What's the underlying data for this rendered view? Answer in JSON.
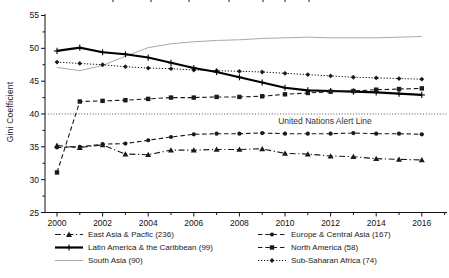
{
  "figure": {
    "background": "#ffffff",
    "axis_color": "#111111",
    "alert_line_color": "#444444"
  },
  "chart_data": {
    "type": "line",
    "title": "",
    "xlabel": "",
    "ylabel": "Gini Coefficient",
    "ylim": [
      25,
      55
    ],
    "xlim": [
      1999.4,
      2017.2
    ],
    "yticks": [
      25,
      30,
      35,
      40,
      45,
      50,
      55
    ],
    "xticks": [
      2000,
      2002,
      2004,
      2006,
      2008,
      2010,
      2012,
      2014,
      2016
    ],
    "grid": false,
    "legend_position": "bottom-two-columns",
    "annotation": {
      "text": "United Nations Alert Line",
      "value": 40,
      "style": "dotted-horizontal-line"
    },
    "x": [
      2000,
      2001,
      2002,
      2003,
      2004,
      2005,
      2006,
      2007,
      2008,
      2009,
      2010,
      2011,
      2012,
      2013,
      2014,
      2015,
      2016
    ],
    "series": [
      {
        "name": "East Asia & Pacfic (236)",
        "marker": "triangle",
        "line": "dashdot",
        "color": "#1a1a1a",
        "values": [
          35.2,
          34.9,
          35.3,
          33.9,
          33.8,
          34.5,
          34.5,
          34.6,
          34.6,
          34.7,
          34.0,
          33.9,
          33.6,
          33.5,
          33.2,
          33.1,
          33.0
        ]
      },
      {
        "name": "Europe & Central Asia (167)",
        "marker": "circle",
        "line": "dashed",
        "color": "#1a1a1a",
        "values": [
          34.9,
          35.0,
          35.4,
          35.5,
          36.0,
          36.5,
          36.9,
          37.0,
          37.0,
          37.1,
          37.0,
          37.0,
          37.0,
          37.1,
          37.0,
          37.0,
          36.9
        ]
      },
      {
        "name": "Latin America & the Caribbean (99)",
        "marker": "plus",
        "line": "solid-thick",
        "color": "#000000",
        "values": [
          49.6,
          50.1,
          49.4,
          49.1,
          48.6,
          47.8,
          47.0,
          46.4,
          45.6,
          44.8,
          44.0,
          43.6,
          43.5,
          43.4,
          43.3,
          43.1,
          42.9
        ]
      },
      {
        "name": "North America (58)",
        "marker": "square",
        "line": "dashed",
        "color": "#1a1a1a",
        "values": [
          31.1,
          41.9,
          42.0,
          42.1,
          42.3,
          42.5,
          42.5,
          42.6,
          42.6,
          42.7,
          43.0,
          43.2,
          43.4,
          43.5,
          43.7,
          43.8,
          43.9
        ]
      },
      {
        "name": "South Asia (90)",
        "marker": "none",
        "line": "solid",
        "color": "#a9a9a9",
        "values": [
          47.1,
          46.6,
          47.4,
          48.8,
          50.1,
          50.7,
          51.0,
          51.2,
          51.3,
          51.5,
          51.6,
          51.7,
          51.6,
          51.6,
          51.6,
          51.7,
          51.8
        ]
      },
      {
        "name": "Sub-Saharan Africa (74)",
        "marker": "diamond",
        "line": "dotted",
        "color": "#1a1a1a",
        "values": [
          47.9,
          47.7,
          47.5,
          47.2,
          47.0,
          46.9,
          46.7,
          46.6,
          46.5,
          46.4,
          46.2,
          46.0,
          45.8,
          45.6,
          45.5,
          45.4,
          45.3
        ]
      }
    ]
  }
}
